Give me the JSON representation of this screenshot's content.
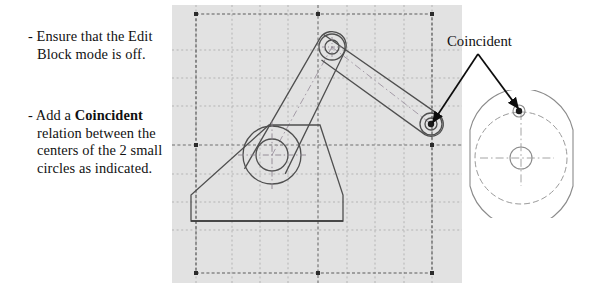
{
  "instructions": {
    "items": [
      {
        "id": "bullet-1",
        "dash": "-",
        "text": "Ensure that the Edit Block mode is off."
      },
      {
        "id": "bullet-2",
        "dash": "-",
        "prefix": "Add a ",
        "emphasis": "Coincident",
        "suffix": " relation between the centers of the 2 small circles as indicated."
      }
    ]
  },
  "annotation": {
    "label": "Coincident",
    "leader_origin": {
      "x": 478,
      "y": 54
    },
    "arrow_targets": [
      {
        "name": "drawing-pivot-point",
        "x": 431,
        "y": 124
      },
      {
        "name": "detail-view-point",
        "x": 519,
        "y": 111
      }
    ]
  },
  "cad_panel": {
    "background_color": "#e2e2e2",
    "grid": {
      "visible": true,
      "line_style": "dashed",
      "line_color": "#b4b4b4",
      "vertical_lines": [
        24,
        60,
        88,
        116,
        146,
        175,
        203,
        232,
        260
      ],
      "horizontal_lines": [
        9,
        45,
        73,
        101,
        140,
        169,
        197,
        225,
        268
      ],
      "origin_axis_color": "#6e6e6e",
      "origin_x": 146,
      "origin_y": 140
    },
    "selection_box": {
      "x": 24,
      "y": 9,
      "width": 236,
      "height": 259,
      "style": "dashed",
      "color": "#5a5a5a",
      "handle_color": "#2b2b2b",
      "handle_size": 4
    },
    "geometry": {
      "stroke_color": "#555555",
      "centerline_color": "#9a8f9a",
      "base": {
        "name": "triangular-base",
        "points": "19,216 19,190 100,120 147,120 171,190 171,216"
      },
      "hub": {
        "name": "lower-hub",
        "cx": 100,
        "cy": 150,
        "outer_r": 29,
        "inner_r": 16
      },
      "top_pivot": {
        "name": "top-pivot",
        "cx": 160,
        "cy": 42,
        "outer_r": 13,
        "inner_r": 7
      },
      "right_pivot": {
        "name": "right-pivot",
        "cx": 259,
        "cy": 119,
        "outer_r": 11,
        "inner_r": 6,
        "dot_r": 3.2,
        "dot_color": "#1a1a1a"
      },
      "link_lower": {
        "name": "lower-link",
        "from": "hub",
        "to": "top-pivot"
      },
      "link_upper": {
        "name": "upper-link",
        "from": "top-pivot",
        "to": "right-pivot"
      }
    }
  },
  "detail_view": {
    "stroke_color": "#8b8b8b",
    "dashed_color": "#9a9a9a",
    "body": {
      "name": "cam-body",
      "cx": 59,
      "cy": 68,
      "rx": 52,
      "ry": 54,
      "flat_left_x": 8,
      "flat_right_x": 111
    },
    "inner_circle": {
      "name": "inner-dashed-circle",
      "cx": 59,
      "cy": 68,
      "r": 46
    },
    "center_hole": {
      "name": "center-hole",
      "cx": 59,
      "cy": 68,
      "r": 11
    },
    "small_circle": {
      "name": "small-top-circle",
      "cx": 57,
      "cy": 21,
      "r": 6,
      "dot_r": 3.2,
      "dot_color": "#1a1a1a"
    }
  }
}
